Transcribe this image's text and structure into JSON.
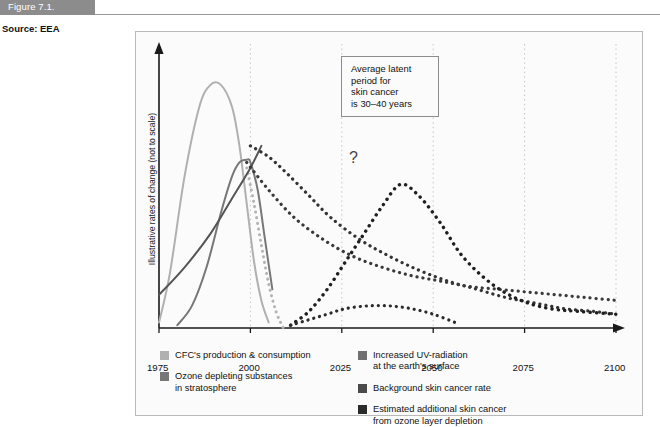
{
  "header": {
    "figure_tag": "Figure 7.1.",
    "source": "Source: EEA",
    "tag_bg": "#8c8c8c"
  },
  "annotation": {
    "lines": [
      "Average latent",
      "period for",
      "skin cancer",
      "is 30–40 years"
    ]
  },
  "uncertainty_marker": "?",
  "legend": {
    "left": [
      {
        "label_lines": [
          "CFC's production & consumption"
        ],
        "color": "#b0b0b0"
      },
      {
        "label_lines": [
          "Ozone depleting substances",
          "in stratosphere"
        ],
        "color": "#777777"
      }
    ],
    "right": [
      {
        "label_lines": [
          "Increased UV-radiation",
          "at the earth's surface"
        ],
        "color": "#707070"
      },
      {
        "label_lines": [
          "Background skin cancer rate"
        ],
        "color": "#4a4a4a"
      },
      {
        "label_lines": [
          "Estimated additional skin cancer",
          "from ozone layer depletion"
        ],
        "color": "#2b2b2b"
      }
    ]
  },
  "chart_data": {
    "type": "line",
    "title": "",
    "xlabel": "",
    "ylabel": "Illustrative rates of change (not to scale)",
    "xlim": [
      1975,
      2100
    ],
    "ylim": [
      0,
      100
    ],
    "xticks": [
      1975,
      2000,
      2025,
      2050,
      2075,
      2100
    ],
    "grid": "vertical-dotted",
    "legend_position": "below-plot",
    "axis_arrow": true,
    "series": [
      {
        "name": "CFC's production & consumption",
        "color": "#b0b0b0",
        "style": "solid",
        "width": 2.0,
        "x": [
          1975,
          1978,
          1982,
          1986,
          1989,
          1992,
          1995,
          1997,
          1999,
          2001,
          2003,
          2005
        ],
        "y": [
          2,
          20,
          55,
          80,
          88,
          88,
          80,
          66,
          45,
          24,
          10,
          2
        ]
      },
      {
        "name": "Ozone depleting substances in stratosphere",
        "color": "#777777",
        "style": "solid",
        "width": 2.0,
        "x": [
          1980,
          1984,
          1988,
          1992,
          1995,
          1997,
          1999,
          2000,
          2002,
          2004,
          2006
        ],
        "y": [
          1,
          8,
          22,
          42,
          55,
          60,
          61,
          60,
          50,
          32,
          14
        ]
      },
      {
        "name": "Ozone depleting substances in stratosphere (decline)",
        "color": "#b4b4b4",
        "style": "dotted",
        "width": 3.0,
        "x": [
          1999,
          2001,
          2003,
          2005,
          2007,
          2009
        ],
        "y": [
          58,
          45,
          30,
          16,
          6,
          0
        ]
      },
      {
        "name": "Increased UV-radiation at the earth's surface",
        "color": "#555555",
        "style": "solid",
        "width": 2.0,
        "x": [
          1975,
          1982,
          1989,
          1995,
          2000,
          2003
        ],
        "y": [
          12,
          22,
          34,
          47,
          58,
          66
        ]
      },
      {
        "name": "Increased UV-radiation at the earth's surface (projection)",
        "color": "#333333",
        "style": "dotted",
        "width": 3.2,
        "x": [
          2000,
          2005,
          2010,
          2016,
          2022,
          2030,
          2038,
          2046,
          2054,
          2062,
          2070,
          2078,
          2086,
          2094,
          2100
        ],
        "y": [
          66,
          62,
          56,
          48,
          40,
          32,
          26,
          21,
          17,
          14,
          11,
          9,
          7,
          6,
          5
        ]
      },
      {
        "name": "Background skin cancer rate",
        "color": "#3a3a3a",
        "style": "dotted",
        "width": 3.2,
        "x": [
          1999,
          2005,
          2012,
          2020,
          2028,
          2036,
          2044,
          2052,
          2060,
          2068,
          2076,
          2084,
          2092,
          2100
        ],
        "y": [
          60,
          50,
          40,
          32,
          26,
          22,
          19,
          17,
          15,
          14,
          13,
          12,
          11,
          10
        ]
      },
      {
        "name": "Estimated additional skin cancer from ozone layer depletion",
        "color": "#1f1f1f",
        "style": "dotted",
        "width": 3.4,
        "x": [
          2011,
          2016,
          2021,
          2026,
          2031,
          2036,
          2041,
          2046,
          2052,
          2058,
          2066,
          2074,
          2082,
          2090,
          2100
        ],
        "y": [
          1,
          6,
          14,
          24,
          34,
          44,
          52,
          48,
          38,
          26,
          16,
          10,
          7,
          6,
          5
        ]
      },
      {
        "name": "Uncertainty branch",
        "color": "#2b2b2b",
        "style": "dotted",
        "width": 3.2,
        "x": [
          2011,
          2016,
          2021,
          2026,
          2032,
          2038,
          2044,
          2050,
          2056
        ],
        "y": [
          1,
          3,
          5,
          7,
          8,
          8,
          7,
          5,
          2
        ]
      }
    ]
  }
}
